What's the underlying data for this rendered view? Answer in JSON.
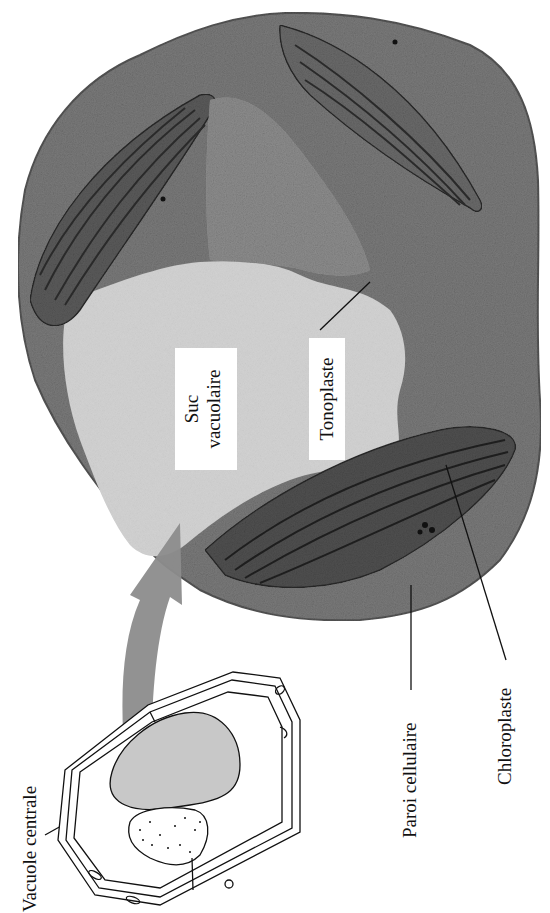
{
  "figure": {
    "orientation": "rotated-90-ccw",
    "colors": {
      "cytoplasm": "#6e6e6e",
      "vacuole_sap": "#cfcfcf",
      "chloroplast_dark": "#3a3a3a",
      "arrow": "#8a8a8a",
      "schematic_vacuole": "#c8c8c8",
      "line": "#111111",
      "background": "#ffffff"
    }
  },
  "labels": {
    "suc_line1": "Suc",
    "suc_line2": "vacuolaire",
    "tonoplaste": "Tonoplaste",
    "paroi": "Paroi cellulaire",
    "chloroplaste": "Chloroplaste",
    "vacuole_centrale": "Vacuole centrale"
  }
}
